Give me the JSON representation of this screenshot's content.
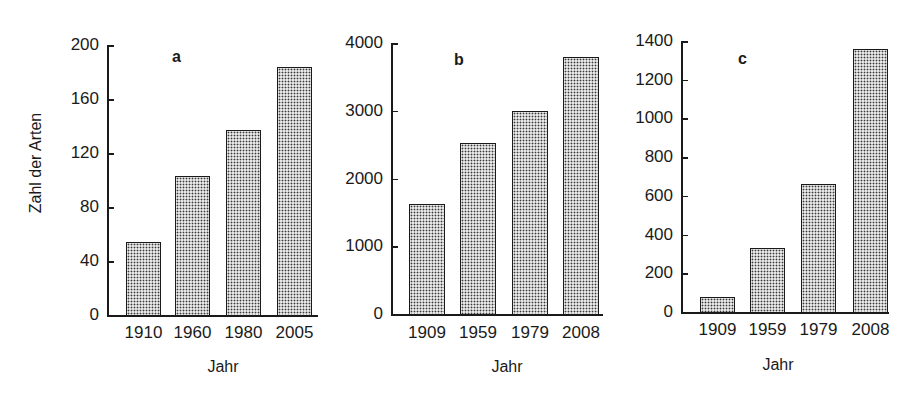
{
  "ylabel": "Zahl der Arten",
  "chart_data": [
    {
      "type": "bar",
      "title": "a",
      "xlabel": "Jahr",
      "ylabel": "Zahl der Arten",
      "categories": [
        "1910",
        "1960",
        "1980",
        "2005"
      ],
      "values": [
        54,
        103,
        137,
        184
      ],
      "ylim": [
        0,
        200
      ],
      "yticks": [
        "0",
        "40",
        "80",
        "120",
        "160",
        "200"
      ],
      "grid": false,
      "legend": null
    },
    {
      "type": "bar",
      "title": "b",
      "xlabel": "Jahr",
      "ylabel": "",
      "categories": [
        "1909",
        "1959",
        "1979",
        "2008"
      ],
      "values": [
        1620,
        2530,
        3000,
        3790
      ],
      "ylim": [
        0,
        4000
      ],
      "yticks": [
        "0",
        "1000",
        "2000",
        "3000",
        "4000"
      ],
      "grid": false,
      "legend": null
    },
    {
      "type": "bar",
      "title": "c",
      "xlabel": "Jahr",
      "ylabel": "",
      "categories": [
        "1909",
        "1959",
        "1979",
        "2008"
      ],
      "values": [
        80,
        330,
        660,
        1360
      ],
      "ylim": [
        0,
        1400
      ],
      "yticks": [
        "0",
        "200",
        "400",
        "600",
        "800",
        "1000",
        "1200",
        "1400"
      ],
      "grid": false,
      "legend": null
    }
  ]
}
